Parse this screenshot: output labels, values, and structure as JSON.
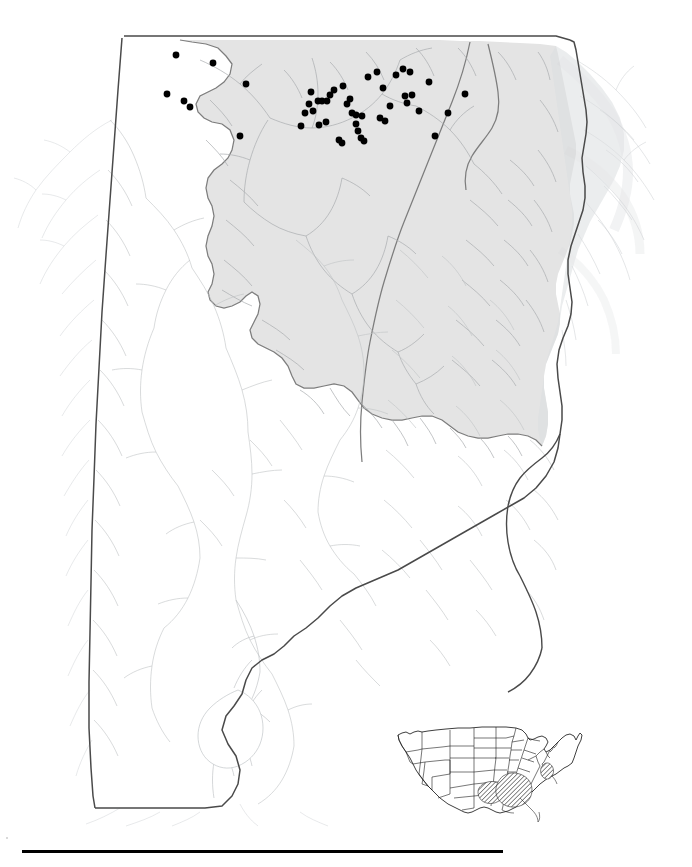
{
  "figure": {
    "domain": "map",
    "type": "species-distribution-dot-map",
    "background_color": "#ffffff",
    "caption_rule_present": true
  },
  "main_map": {
    "name": "alabama-state-map",
    "region_label": "Alabama",
    "state_outline_color": "#3a3a3a",
    "state_fill_color": "#ffffff",
    "hydrography_color": "#b4b7ba",
    "highlight_region_name": "shaded-physiographic-region",
    "highlight_fill_color": "#e4e4e4",
    "highlight_outline_color": "#7d7d7d",
    "occurrence_dot_color": "#000000",
    "occurrence_dot_radius": 3.4,
    "occurrence_count": 48,
    "occurrence_points": [
      [
        176,
        55
      ],
      [
        213,
        63
      ],
      [
        246,
        84
      ],
      [
        167,
        94
      ],
      [
        184,
        101
      ],
      [
        190,
        107
      ],
      [
        240,
        136
      ],
      [
        301,
        126
      ],
      [
        319,
        125
      ],
      [
        326,
        122
      ],
      [
        334,
        90
      ],
      [
        343,
        86
      ],
      [
        330,
        95
      ],
      [
        347,
        104
      ],
      [
        352,
        113
      ],
      [
        356,
        115
      ],
      [
        362,
        116
      ],
      [
        356,
        124
      ],
      [
        358,
        131
      ],
      [
        361,
        138
      ],
      [
        364,
        141
      ],
      [
        311,
        92
      ],
      [
        318,
        101
      ],
      [
        322,
        101
      ],
      [
        327,
        101
      ],
      [
        309,
        104
      ],
      [
        313,
        111
      ],
      [
        305,
        113
      ],
      [
        339,
        140
      ],
      [
        342,
        143
      ],
      [
        368,
        77
      ],
      [
        377,
        72
      ],
      [
        383,
        88
      ],
      [
        390,
        106
      ],
      [
        396,
        75
      ],
      [
        403,
        69
      ],
      [
        410,
        72
      ],
      [
        405,
        96
      ],
      [
        407,
        103
      ],
      [
        412,
        95
      ],
      [
        380,
        118
      ],
      [
        385,
        121
      ],
      [
        419,
        111
      ],
      [
        435,
        136
      ],
      [
        448,
        113
      ],
      [
        465,
        94
      ],
      [
        429,
        82
      ],
      [
        350,
        99
      ]
    ]
  },
  "inset_map": {
    "name": "united-states-locator-inset",
    "region_label": "United States",
    "outline_color": "#1c1c1c",
    "fill_color": "#ffffff",
    "hatch_fill_color": "#9a9a9a",
    "hatched_region_count": 3,
    "hatched_region_labels": [
      "ozark-ouachita-range",
      "interior-low-plateau-cumberland-range",
      "mid-atlantic-piedmont-range"
    ]
  }
}
